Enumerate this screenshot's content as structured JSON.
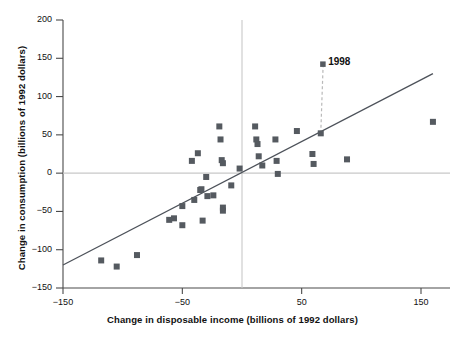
{
  "chart_data": {
    "type": "scatter",
    "title": "",
    "xlabel": "Change in disposable income (billions of 1992 dollars)",
    "ylabel": "Change in consumption (billions of 1992 dollars)",
    "xlim": [
      -150,
      170
    ],
    "ylim": [
      -150,
      200
    ],
    "xticks": [
      -150,
      -50,
      50,
      150
    ],
    "xtick_labels": [
      "−150",
      "−50",
      "50",
      "150"
    ],
    "yticks": [
      -150,
      -100,
      -50,
      0,
      50,
      100,
      150,
      200
    ],
    "ytick_labels": [
      "−150",
      "−100",
      "−50",
      "0",
      "50",
      "100",
      "150",
      "200"
    ],
    "grid": false,
    "zero_lines": {
      "x": 0,
      "y": 0
    },
    "legend": "none",
    "marker": {
      "shape": "square",
      "color": "#555a60",
      "size": 6
    },
    "series": [
      {
        "name": "Annual change in income vs consumption",
        "points": [
          [
            -118,
            -114
          ],
          [
            -105,
            -122
          ],
          [
            -88,
            -107
          ],
          [
            -61,
            -61
          ],
          [
            -57,
            -59
          ],
          [
            -50,
            -68
          ],
          [
            -50,
            -43
          ],
          [
            -42,
            16
          ],
          [
            -40,
            -35
          ],
          [
            -37,
            26
          ],
          [
            -35,
            -22
          ],
          [
            -34,
            -21
          ],
          [
            -33,
            -62
          ],
          [
            -30,
            -5
          ],
          [
            -29,
            -30
          ],
          [
            -24,
            -29
          ],
          [
            -19,
            61
          ],
          [
            -18,
            44
          ],
          [
            -17,
            17
          ],
          [
            -16,
            13
          ],
          [
            -16,
            -45
          ],
          [
            -16,
            -49
          ],
          [
            -9,
            -16
          ],
          [
            -2,
            6
          ],
          [
            11,
            61
          ],
          [
            12,
            44
          ],
          [
            13,
            38
          ],
          [
            14,
            22
          ],
          [
            17,
            10
          ],
          [
            28,
            44
          ],
          [
            29,
            16
          ],
          [
            30,
            -1
          ],
          [
            46,
            55
          ],
          [
            59,
            25
          ],
          [
            60,
            12
          ],
          [
            66,
            52
          ],
          [
            88,
            18
          ],
          [
            160,
            67
          ]
        ]
      }
    ],
    "regression_line": {
      "label": "fitted line",
      "x_start": -150,
      "y_start": -120,
      "x_end": 160,
      "y_end": 130
    },
    "annotations": [
      {
        "text": "1998",
        "point_x": 66,
        "point_y": 52,
        "label_x": 68,
        "label_y": 142,
        "leader": "dashed-vertical",
        "marker": true
      }
    ]
  },
  "chart_meta": {
    "axis_color": "#4a4a4a",
    "zero_line_color": "#c8c8c8",
    "line_color": "#4d525a",
    "leader_color": "#b9b9b9",
    "marker_color": "#555a60",
    "background": "#ffffff"
  }
}
